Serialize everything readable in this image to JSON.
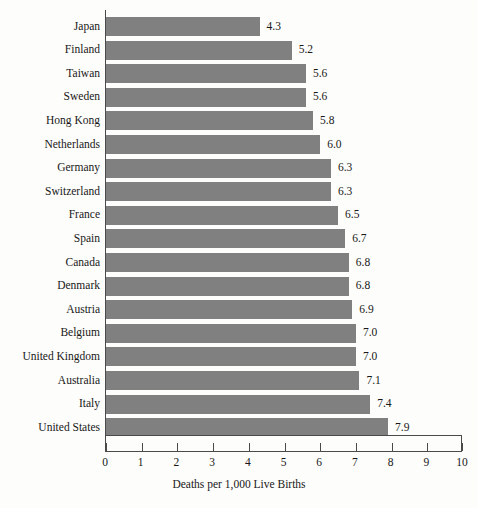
{
  "chart_data": {
    "type": "bar",
    "orientation": "horizontal",
    "title": "",
    "xlabel": "Deaths per 1,000 Live Births",
    "ylabel": "",
    "xlim": [
      0,
      10
    ],
    "xticks": [
      "0",
      "1",
      "2",
      "3",
      "4",
      "5",
      "6",
      "7",
      "8",
      "9",
      "10"
    ],
    "grid": false,
    "legend": false,
    "bar_color": "#808080",
    "axis_color": "#4a4a4a",
    "background_color": "#fdfdfb",
    "categories": [
      "Japan",
      "Finland",
      "Taiwan",
      "Sweden",
      "Hong Kong",
      "Netherlands",
      "Germany",
      "Switzerland",
      "France",
      "Spain",
      "Canada",
      "Denmark",
      "Austria",
      "Belgium",
      "United Kingdom",
      "Australia",
      "Italy",
      "United States"
    ],
    "values": [
      4.3,
      5.2,
      5.6,
      5.6,
      5.8,
      6.0,
      6.3,
      6.3,
      6.5,
      6.7,
      6.8,
      6.8,
      6.9,
      7.0,
      7.0,
      7.1,
      7.4,
      7.9
    ],
    "value_labels": [
      "4.3",
      "5.2",
      "5.6",
      "5.6",
      "5.8",
      "6.0",
      "6.3",
      "6.3",
      "6.5",
      "6.7",
      "6.8",
      "6.8",
      "6.9",
      "7.0",
      "7.0",
      "7.1",
      "7.4",
      "7.9"
    ]
  }
}
